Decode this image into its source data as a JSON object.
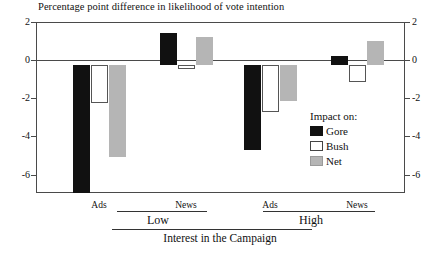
{
  "chart_data": {
    "type": "bar",
    "title": "Percentage point difference in likelihood of vote intention",
    "xlabel": "Interest in the Campaign",
    "ylabel": "",
    "ylim": [
      -6,
      2
    ],
    "yticks": [
      2,
      0,
      -2,
      -4,
      -6
    ],
    "grid": false,
    "dual_y_axis": true,
    "legend_position": "inside-right",
    "legend_title": "Impact on:",
    "categories": [
      "Ads",
      "News",
      "Ads",
      "News"
    ],
    "supergroups": [
      {
        "label": "Low",
        "categories": [
          "Ads",
          "News"
        ]
      },
      {
        "label": "High",
        "categories": [
          "Ads",
          "News"
        ]
      }
    ],
    "series": [
      {
        "name": "Gore",
        "color": "#111111",
        "values": [
          -6.0,
          1.5,
          -4.0,
          0.4
        ]
      },
      {
        "name": "Bush",
        "color": "#ffffff",
        "values": [
          -1.8,
          -0.2,
          -2.2,
          -0.8
        ]
      },
      {
        "name": "Net",
        "color": "#b5b5b5",
        "values": [
          -4.3,
          1.3,
          -1.7,
          1.1
        ]
      }
    ]
  },
  "axis": {
    "left_ticks": [
      "2",
      "0",
      "-2",
      "-4",
      "-6"
    ],
    "right_ticks": [
      "2",
      "0",
      "-2",
      "-4",
      "-6"
    ]
  },
  "legend": {
    "title": "Impact on:",
    "items": [
      {
        "label": "Gore"
      },
      {
        "label": "Bush"
      },
      {
        "label": "Net"
      }
    ]
  },
  "xaxis": {
    "ticks": [
      "Ads",
      "News",
      "Ads",
      "News"
    ],
    "groups": [
      "Low",
      "High"
    ],
    "title": "Interest in the Campaign"
  }
}
